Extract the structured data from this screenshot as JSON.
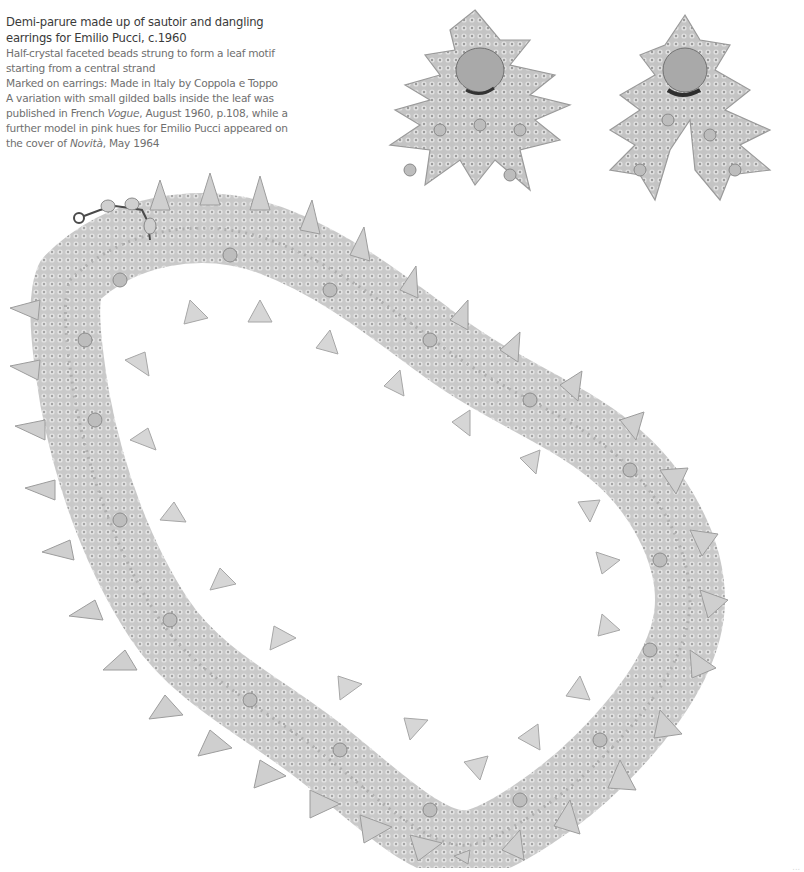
{
  "caption": {
    "title": "Demi-parure made up of sautoir and dangling earrings for Emilio Pucci, c.1960",
    "description": "Half-crystal faceted beads strung to form a leaf motif starting from a central strand",
    "marking": "Marked on earrings: Made in Italy by Coppola e Toppo",
    "note_part1": "A variation with small gilded balls inside the leaf was published in French ",
    "note_vogue": "Vogue",
    "note_part2": ", August 1960, p.108, while a further model in pink hues for Emilio Pucci appeared on the cover of ",
    "note_novita": "Novità",
    "note_part3": ", May 1964"
  },
  "photo": {
    "subject": "Crystal bead leaf-motif sautoir necklace with pair of dangling earrings",
    "background": "#ffffff",
    "bead_color": "#b9b9b9",
    "bead_shadow": "#8e8e8e",
    "clasp_color": "#4a4a4a"
  },
  "folio": "..."
}
